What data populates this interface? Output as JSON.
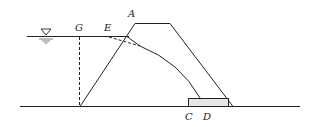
{
  "diagram": {
    "labels": {
      "A": "A",
      "G": "G",
      "E": "E",
      "C": "C",
      "D": "D"
    },
    "symbols": {
      "water_level": "water-level-triangle-icon"
    },
    "colors": {
      "line": "#222222",
      "drain_fill": "#e6e6e6",
      "background": "#ffffff"
    }
  }
}
